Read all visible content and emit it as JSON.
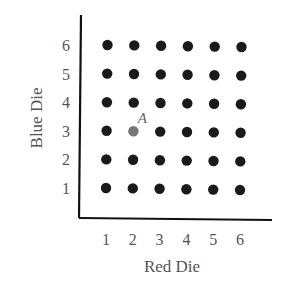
{
  "chart_data": {
    "type": "scatter",
    "title": "",
    "xlabel": "Red Die",
    "ylabel": "Blue Die",
    "x_ticks": [
      "1",
      "2",
      "3",
      "4",
      "5",
      "6"
    ],
    "y_ticks": [
      "1",
      "2",
      "3",
      "4",
      "5",
      "6"
    ],
    "xlim": [
      0.5,
      6.5
    ],
    "ylim": [
      0.5,
      6.5
    ],
    "grid": false,
    "points": [
      {
        "x": 1,
        "y": 1
      },
      {
        "x": 2,
        "y": 1
      },
      {
        "x": 3,
        "y": 1
      },
      {
        "x": 4,
        "y": 1
      },
      {
        "x": 5,
        "y": 1
      },
      {
        "x": 6,
        "y": 1
      },
      {
        "x": 1,
        "y": 2
      },
      {
        "x": 2,
        "y": 2
      },
      {
        "x": 3,
        "y": 2
      },
      {
        "x": 4,
        "y": 2
      },
      {
        "x": 5,
        "y": 2
      },
      {
        "x": 6,
        "y": 2
      },
      {
        "x": 1,
        "y": 3
      },
      {
        "x": 2,
        "y": 3
      },
      {
        "x": 3,
        "y": 3
      },
      {
        "x": 4,
        "y": 3
      },
      {
        "x": 5,
        "y": 3
      },
      {
        "x": 6,
        "y": 3
      },
      {
        "x": 1,
        "y": 4
      },
      {
        "x": 2,
        "y": 4
      },
      {
        "x": 3,
        "y": 4
      },
      {
        "x": 4,
        "y": 4
      },
      {
        "x": 5,
        "y": 4
      },
      {
        "x": 6,
        "y": 4
      },
      {
        "x": 1,
        "y": 5
      },
      {
        "x": 2,
        "y": 5
      },
      {
        "x": 3,
        "y": 5
      },
      {
        "x": 4,
        "y": 5
      },
      {
        "x": 5,
        "y": 5
      },
      {
        "x": 6,
        "y": 5
      },
      {
        "x": 1,
        "y": 6
      },
      {
        "x": 2,
        "y": 6
      },
      {
        "x": 3,
        "y": 6
      },
      {
        "x": 4,
        "y": 6
      },
      {
        "x": 5,
        "y": 6
      },
      {
        "x": 6,
        "y": 6
      }
    ],
    "annotations": [
      {
        "label": "A",
        "x": 2,
        "y": 3,
        "color": "#777777"
      }
    ],
    "point_color": "#1a1a1a"
  }
}
